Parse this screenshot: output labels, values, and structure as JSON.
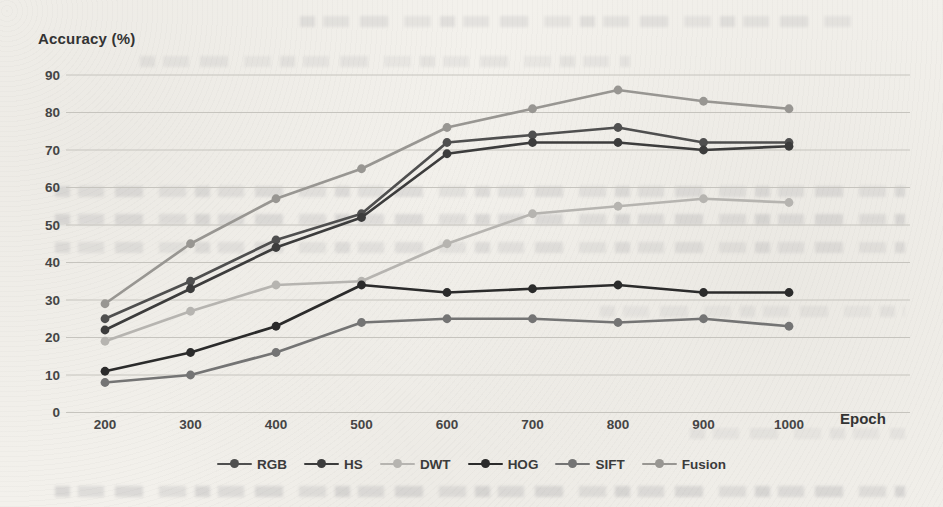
{
  "page": {
    "type": "scanned-book-figure",
    "paper_color": "#f3f1ec",
    "text_color": "#3f3f3f"
  },
  "chart_data": {
    "type": "line",
    "title": "",
    "ylabel": "Accuracy (%)",
    "xlabel": "Epoch",
    "x": [
      200,
      300,
      400,
      500,
      600,
      700,
      800,
      900,
      1000
    ],
    "x_tick_labels": [
      "200",
      "300",
      "400",
      "500",
      "600",
      "700",
      "800",
      "900",
      "1000"
    ],
    "yticks": [
      0,
      10,
      20,
      30,
      40,
      50,
      60,
      70,
      80,
      90
    ],
    "ylim": [
      0,
      90
    ],
    "grid": true,
    "gridline_color": "#c6c4be",
    "legend_position": "bottom",
    "marker": "circle",
    "series": [
      {
        "name": "RGB",
        "color": "#4f4f4f",
        "values": [
          25,
          35,
          46,
          53,
          72,
          74,
          76,
          72,
          72
        ]
      },
      {
        "name": "HS",
        "color": "#3c3c3c",
        "values": [
          22,
          33,
          44,
          52,
          69,
          72,
          72,
          70,
          71
        ]
      },
      {
        "name": "DWT",
        "color": "#b6b4b0",
        "values": [
          19,
          27,
          34,
          35,
          45,
          53,
          55,
          57,
          56
        ]
      },
      {
        "name": "HOG",
        "color": "#2b2b2b",
        "values": [
          11,
          16,
          23,
          34,
          32,
          33,
          34,
          32,
          32
        ]
      },
      {
        "name": "SIFT",
        "color": "#747474",
        "values": [
          8,
          10,
          16,
          24,
          25,
          25,
          24,
          25,
          23
        ]
      },
      {
        "name": "Fusion",
        "color": "#989692",
        "values": [
          29,
          45,
          57,
          65,
          76,
          81,
          86,
          83,
          81
        ]
      }
    ]
  }
}
